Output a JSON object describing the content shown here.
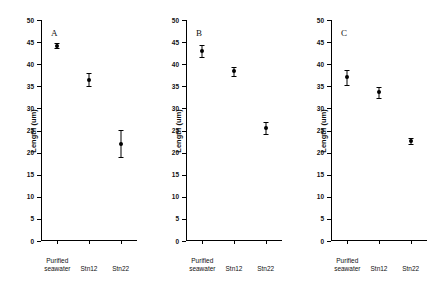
{
  "figure": {
    "panels": [
      {
        "letter": "A",
        "ylabel": "Length (um)",
        "categories": [
          "Purified\nseawater",
          "Stn12",
          "Stn22"
        ],
        "ytick_labels": [
          "0",
          "5",
          "10",
          "15",
          "20",
          "25",
          "30",
          "35",
          "40",
          "45",
          "50"
        ]
      },
      {
        "letter": "B",
        "ylabel": "Length (um)",
        "categories": [
          "Purified\nseawater",
          "Stn12",
          "Stn22"
        ],
        "ytick_labels": [
          "0",
          "5",
          "10",
          "15",
          "20",
          "25",
          "30",
          "35",
          "40",
          "45",
          "50"
        ]
      },
      {
        "letter": "C",
        "ylabel": "Length (um)",
        "categories": [
          "Purified\nseawater",
          "Stn12",
          "Stn22"
        ],
        "ytick_labels": [
          "0",
          "5",
          "10",
          "15",
          "20",
          "25",
          "30",
          "35",
          "40",
          "45",
          "50"
        ]
      }
    ]
  },
  "chart_data": [
    {
      "type": "scatter",
      "title": "A",
      "xlabel": "",
      "ylabel": "Length (um)",
      "categories": [
        "Purified seawater",
        "Stn12",
        "Stn22"
      ],
      "values": [
        44.2,
        36.5,
        22.0
      ],
      "errors_low": [
        0.6,
        1.5,
        3.0
      ],
      "errors_high": [
        0.6,
        1.5,
        3.2
      ],
      "ylim": [
        0,
        50
      ],
      "ytick_step": 5,
      "grid": false,
      "legend": "none"
    },
    {
      "type": "scatter",
      "title": "B",
      "xlabel": "",
      "ylabel": "Length (um)",
      "categories": [
        "Purified seawater",
        "Stn12",
        "Stn22"
      ],
      "values": [
        43.0,
        38.4,
        25.6
      ],
      "errors_low": [
        1.3,
        1.0,
        1.4
      ],
      "errors_high": [
        1.3,
        1.0,
        1.4
      ],
      "ylim": [
        0,
        50
      ],
      "ytick_step": 5,
      "grid": false,
      "legend": "none"
    },
    {
      "type": "scatter",
      "title": "C",
      "xlabel": "",
      "ylabel": "Length (um)",
      "categories": [
        "Purified seawater",
        "Stn12",
        "Stn22"
      ],
      "values": [
        37.0,
        33.6,
        22.6
      ],
      "errors_low": [
        1.8,
        1.2,
        0.7
      ],
      "errors_high": [
        1.8,
        1.2,
        0.7
      ],
      "ylim": [
        0,
        50
      ],
      "ytick_step": 5,
      "grid": false,
      "legend": "none"
    }
  ]
}
